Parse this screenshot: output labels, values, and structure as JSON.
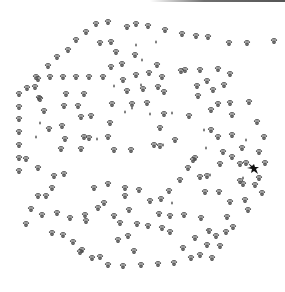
{
  "image": {
    "description": "Paw-print tracks arranged in a circular maze-like pattern with a black animal silhouette",
    "background": "#ffffff",
    "paw_color": "#4a4a4a",
    "creature_color": "#111111",
    "creature": {
      "x": 253,
      "y": 168
    },
    "paws": [
      [
        96,
        24
      ],
      [
        108,
        22
      ],
      [
        127,
        27
      ],
      [
        136,
        24
      ],
      [
        148,
        26
      ],
      [
        165,
        30
      ],
      [
        182,
        34
      ],
      [
        196,
        36
      ],
      [
        208,
        37
      ],
      [
        229,
        43
      ],
      [
        247,
        43
      ],
      [
        274,
        41
      ],
      [
        86,
        32
      ],
      [
        76,
        40
      ],
      [
        68,
        50
      ],
      [
        57,
        57
      ],
      [
        48,
        66
      ],
      [
        38,
        79
      ],
      [
        27,
        88
      ],
      [
        19,
        94
      ],
      [
        36,
        77
      ],
      [
        50,
        77
      ],
      [
        63,
        77
      ],
      [
        76,
        77
      ],
      [
        89,
        77
      ],
      [
        103,
        77
      ],
      [
        35,
        87
      ],
      [
        39,
        98
      ],
      [
        66,
        94
      ],
      [
        84,
        94
      ],
      [
        100,
        43
      ],
      [
        111,
        42
      ],
      [
        116,
        52
      ],
      [
        111,
        67
      ],
      [
        135,
        55
      ],
      [
        122,
        64
      ],
      [
        136,
        75
      ],
      [
        123,
        80
      ],
      [
        149,
        73
      ],
      [
        127,
        91
      ],
      [
        143,
        89
      ],
      [
        157,
        65
      ],
      [
        162,
        77
      ],
      [
        158,
        87
      ],
      [
        164,
        92
      ],
      [
        181,
        71
      ],
      [
        200,
        70
      ],
      [
        218,
        69
      ],
      [
        230,
        74
      ],
      [
        207,
        81
      ],
      [
        224,
        85
      ],
      [
        218,
        104
      ],
      [
        230,
        103
      ],
      [
        197,
        86
      ],
      [
        213,
        90
      ],
      [
        198,
        96
      ],
      [
        185,
        70
      ],
      [
        19,
        107
      ],
      [
        19,
        119
      ],
      [
        19,
        132
      ],
      [
        19,
        145
      ],
      [
        19,
        158
      ],
      [
        19,
        171
      ],
      [
        40,
        99
      ],
      [
        44,
        111
      ],
      [
        49,
        129
      ],
      [
        62,
        126
      ],
      [
        64,
        106
      ],
      [
        78,
        106
      ],
      [
        81,
        117
      ],
      [
        91,
        116
      ],
      [
        65,
        139
      ],
      [
        84,
        137
      ],
      [
        61,
        149
      ],
      [
        81,
        149
      ],
      [
        89,
        138
      ],
      [
        110,
        123
      ],
      [
        108,
        137
      ],
      [
        114,
        150
      ],
      [
        131,
        150
      ],
      [
        160,
        128
      ],
      [
        154,
        145
      ],
      [
        175,
        140
      ],
      [
        112,
        104
      ],
      [
        132,
        104
      ],
      [
        147,
        103
      ],
      [
        164,
        114
      ],
      [
        160,
        146
      ],
      [
        189,
        116
      ],
      [
        211,
        110
      ],
      [
        232,
        115
      ],
      [
        218,
        137
      ],
      [
        232,
        135
      ],
      [
        223,
        152
      ],
      [
        232,
        157
      ],
      [
        242,
        148
      ],
      [
        211,
        130
      ],
      [
        195,
        158
      ],
      [
        207,
        176
      ],
      [
        220,
        164
      ],
      [
        240,
        164
      ],
      [
        259,
        152
      ],
      [
        264,
        137
      ],
      [
        257,
        122
      ],
      [
        249,
        102
      ],
      [
        26,
        159
      ],
      [
        38,
        168
      ],
      [
        54,
        176
      ],
      [
        64,
        174
      ],
      [
        52,
        188
      ],
      [
        38,
        196
      ],
      [
        31,
        209
      ],
      [
        26,
        224
      ],
      [
        46,
        196
      ],
      [
        57,
        213
      ],
      [
        70,
        218
      ],
      [
        85,
        215
      ],
      [
        94,
        188
      ],
      [
        108,
        184
      ],
      [
        125,
        188
      ],
      [
        139,
        190
      ],
      [
        125,
        196
      ],
      [
        129,
        210
      ],
      [
        104,
        203
      ],
      [
        86,
        221
      ],
      [
        137,
        224
      ],
      [
        128,
        236
      ],
      [
        134,
        251
      ],
      [
        150,
        201
      ],
      [
        161,
        199
      ],
      [
        169,
        191
      ],
      [
        180,
        180
      ],
      [
        188,
        168
      ],
      [
        193,
        160
      ],
      [
        200,
        177
      ],
      [
        205,
        192
      ],
      [
        219,
        192
      ],
      [
        227,
        217
      ],
      [
        230,
        202
      ],
      [
        226,
        232
      ],
      [
        216,
        236
      ],
      [
        207,
        245
      ],
      [
        200,
        255
      ],
      [
        191,
        258
      ],
      [
        174,
        263
      ],
      [
        158,
        264
      ],
      [
        141,
        265
      ],
      [
        123,
        266
      ],
      [
        108,
        265
      ],
      [
        92,
        258
      ],
      [
        82,
        250
      ],
      [
        73,
        242
      ],
      [
        63,
        235
      ],
      [
        52,
        233
      ],
      [
        42,
        215
      ],
      [
        80,
        252
      ],
      [
        98,
        208
      ],
      [
        114,
        216
      ],
      [
        120,
        223
      ],
      [
        162,
        228
      ],
      [
        170,
        232
      ],
      [
        184,
        215
      ],
      [
        201,
        218
      ],
      [
        195,
        238
      ],
      [
        170,
        216
      ],
      [
        183,
        248
      ],
      [
        246,
        163
      ],
      [
        265,
        163
      ],
      [
        259,
        178
      ],
      [
        262,
        193
      ],
      [
        248,
        210
      ],
      [
        233,
        227
      ],
      [
        220,
        246
      ],
      [
        212,
        258
      ],
      [
        100,
        257
      ],
      [
        118,
        240
      ],
      [
        148,
        226
      ],
      [
        159,
        214
      ],
      [
        209,
        231
      ],
      [
        245,
        200
      ],
      [
        255,
        185
      ],
      [
        243,
        184
      ],
      [
        240,
        181
      ]
    ],
    "specks": [
      [
        136,
        45
      ],
      [
        142,
        60
      ],
      [
        141,
        85
      ],
      [
        132,
        108
      ],
      [
        40,
        123
      ],
      [
        36,
        137
      ],
      [
        125,
        112
      ],
      [
        150,
        114
      ],
      [
        172,
        113
      ],
      [
        204,
        130
      ],
      [
        206,
        148
      ],
      [
        210,
        175
      ],
      [
        243,
        178
      ],
      [
        172,
        203
      ],
      [
        208,
        230
      ],
      [
        163,
        145
      ],
      [
        97,
        139
      ],
      [
        114,
        86
      ],
      [
        156,
        42
      ],
      [
        246,
        140
      ]
    ]
  }
}
